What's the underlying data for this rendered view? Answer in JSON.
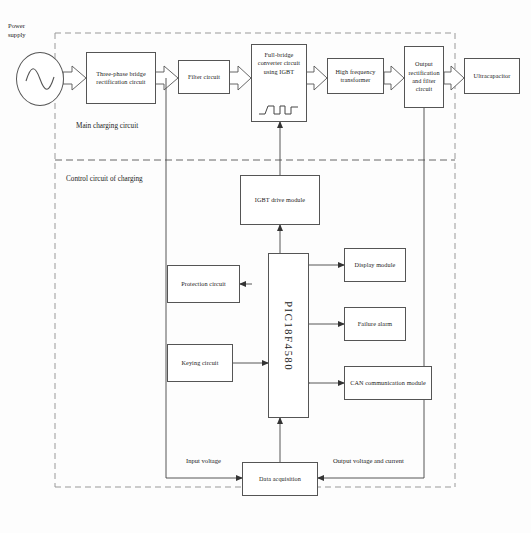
{
  "diagram": {
    "zones": [
      {
        "id": "main",
        "label": "Main charging circuit"
      },
      {
        "id": "control",
        "label": "Control circuit of charging"
      }
    ],
    "source": {
      "label": "Power\nsupply",
      "symbol": "sine-wave"
    },
    "blocks": [
      {
        "id": "rectifier",
        "label": "Three-phase bridge rectification circuit"
      },
      {
        "id": "filter",
        "label": "Filter circuit"
      },
      {
        "id": "converter",
        "label": "Full-bridge converter circuit using IGBT"
      },
      {
        "id": "transformer",
        "label": "High frequency transformer"
      },
      {
        "id": "output",
        "label": "Output rectification and filter circuit"
      },
      {
        "id": "ultracap",
        "label": "Ultracapacitor"
      },
      {
        "id": "igbtdrive",
        "label": "IGBT drive module"
      },
      {
        "id": "mcu",
        "label": "PIC18F4580"
      },
      {
        "id": "protection",
        "label": "Protection circuit"
      },
      {
        "id": "keying",
        "label": "Keying circuit"
      },
      {
        "id": "display",
        "label": "Display module"
      },
      {
        "id": "alarm",
        "label": "Failure alarm"
      },
      {
        "id": "can",
        "label": "CAN communication module"
      },
      {
        "id": "daq",
        "label": "Data acquisition"
      }
    ],
    "signal_labels": [
      {
        "id": "input-voltage",
        "label": "Input voltage"
      },
      {
        "id": "output-voltage",
        "label": "Output voltage and current"
      }
    ],
    "colors": {
      "line": "#555555",
      "text": "#222222",
      "background": "#fdfdfd"
    }
  }
}
